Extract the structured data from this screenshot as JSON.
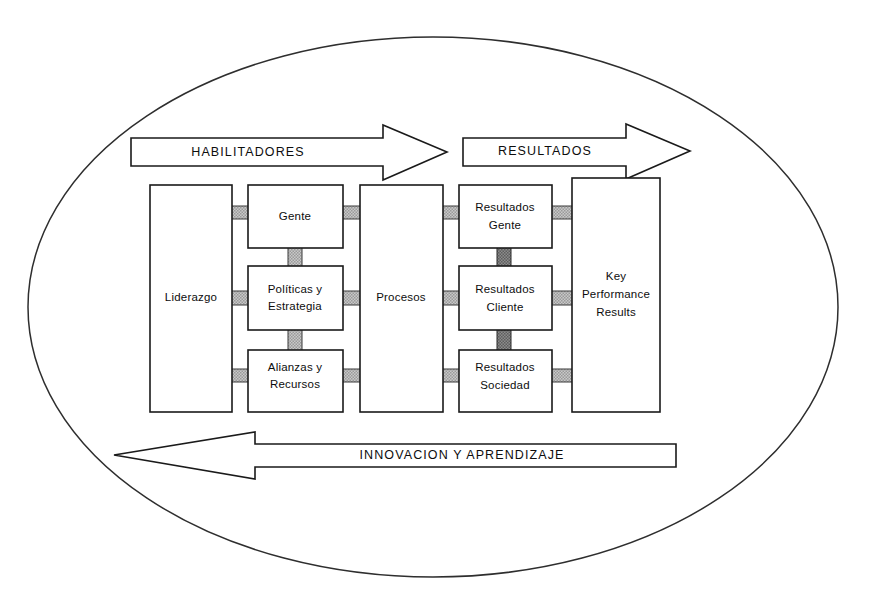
{
  "diagram": {
    "container_shape": "ellipse",
    "colors": {
      "outline": "#1a1a1a",
      "box_fill": "#ffffff",
      "connector_light": "#b5b5b5",
      "connector_dark": "#6e6e6e",
      "background": "#ffffff"
    },
    "banners": [
      {
        "id": "habilitadores",
        "label": "HABILITADORES",
        "direction": "right"
      },
      {
        "id": "resultados",
        "label": "RESULTADOS",
        "direction": "right"
      },
      {
        "id": "innovacion",
        "label": "INNOVACION Y APRENDIZAJE",
        "direction": "left"
      }
    ],
    "columns": [
      {
        "id": "col-liderazgo",
        "group": "habilitadores",
        "boxes": [
          {
            "id": "liderazgo",
            "lines": [
              "Liderazgo"
            ]
          }
        ]
      },
      {
        "id": "col-agentes",
        "group": "habilitadores",
        "boxes": [
          {
            "id": "gente",
            "lines": [
              "Gente"
            ]
          },
          {
            "id": "politicas-estrategia",
            "lines": [
              "Políticas y",
              "Estrategia"
            ]
          },
          {
            "id": "alianzas-recursos",
            "lines": [
              "Alianzas y",
              "Recursos"
            ]
          }
        ]
      },
      {
        "id": "col-procesos",
        "group": "habilitadores",
        "boxes": [
          {
            "id": "procesos",
            "lines": [
              "Procesos"
            ]
          }
        ]
      },
      {
        "id": "col-resultados",
        "group": "resultados",
        "boxes": [
          {
            "id": "resultados-gente",
            "lines": [
              "Resultados",
              "Gente"
            ]
          },
          {
            "id": "resultados-cliente",
            "lines": [
              "Resultados",
              "Cliente"
            ]
          },
          {
            "id": "resultados-sociedad",
            "lines": [
              "Resultados",
              "Sociedad"
            ]
          }
        ]
      },
      {
        "id": "col-kpr",
        "group": "resultados",
        "boxes": [
          {
            "id": "key-performance-results",
            "lines": [
              "Key",
              "Performance",
              "Results"
            ]
          }
        ]
      }
    ]
  }
}
